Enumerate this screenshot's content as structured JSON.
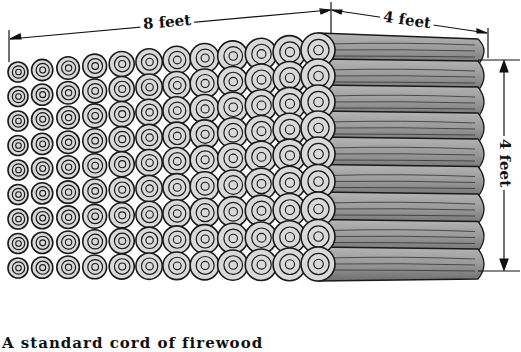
{
  "figure": {
    "dimensions": {
      "length": {
        "label": "8 feet",
        "value": 8,
        "unit": "feet"
      },
      "depth": {
        "label": "4 feet",
        "value": 4,
        "unit": "feet"
      },
      "height": {
        "label": "4 feet",
        "value": 4,
        "unit": "feet"
      }
    },
    "stack": {
      "rows": 9,
      "logs_per_row_front": 12
    },
    "colors": {
      "log_end": "#d9d9d9",
      "log_side": "#9a9a9a",
      "outline": "#1a1a1a",
      "background": "#ffffff"
    },
    "caption_partial": "A standard cord of firewood"
  }
}
